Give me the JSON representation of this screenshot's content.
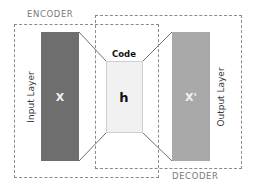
{
  "diagram": {
    "encoder": {
      "label": "ENCODER"
    },
    "decoder": {
      "label": "DECODER"
    },
    "input_layer": {
      "label": "Input Layer",
      "symbol": "X",
      "color": "#6e6e6e"
    },
    "code_layer": {
      "label": "Code",
      "symbol": "h",
      "color": "#f1f1f1"
    },
    "output_layer": {
      "label": "Output Layer",
      "symbol": "X'",
      "color": "#a9a9a9"
    },
    "border_color": "#8a8a8a",
    "connector_color": "#707070"
  }
}
